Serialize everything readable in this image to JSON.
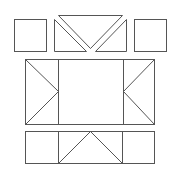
{
  "diagram": {
    "stroke_color": "#555555",
    "background": "#ffffff",
    "top_row": {
      "left_square": {
        "x": 14,
        "y": 19,
        "w": 32,
        "h": 32
      },
      "inverted_triangle": {
        "points": [
          [
            58,
            15
          ],
          [
            122,
            15
          ],
          [
            90,
            48
          ]
        ]
      },
      "left_triangle": {
        "points": [
          [
            54,
            19
          ],
          [
            54,
            51
          ],
          [
            86,
            51
          ]
        ]
      },
      "right_triangle": {
        "points": [
          [
            126,
            19
          ],
          [
            126,
            51
          ],
          [
            95,
            51
          ]
        ]
      },
      "right_square": {
        "x": 134,
        "y": 19,
        "w": 32,
        "h": 32
      }
    },
    "middle_row": {
      "outer_rect": {
        "x": 25,
        "y": 59,
        "w": 129,
        "h": 65
      },
      "left_divider_x": 58,
      "right_divider_x": 123,
      "left_triangle_apex": [
        58,
        91
      ],
      "right_triangle_apex": [
        123,
        91
      ]
    },
    "bottom_row": {
      "outer_rect": {
        "x": 25,
        "y": 131,
        "w": 129,
        "h": 32
      },
      "left_divider_x": 58,
      "right_divider_x": 122,
      "triangle": {
        "points": [
          [
            58,
            163
          ],
          [
            90,
            131
          ],
          [
            122,
            163
          ]
        ]
      }
    }
  }
}
